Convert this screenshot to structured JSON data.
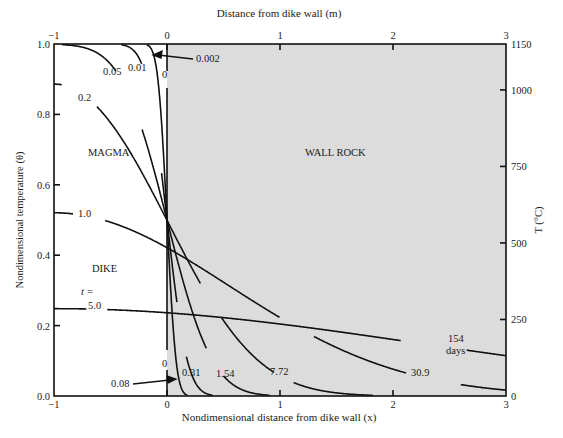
{
  "chart_data": {
    "type": "line",
    "title": "",
    "top_xlabel": "Distance from dike wall (m)",
    "xlabel": "Nondimensional distance from dike wall (x)",
    "ylabel": "Nondimensional temperature (θ)",
    "right_ylabel": "T (°C)",
    "xlim": [
      -1,
      3
    ],
    "ylim": [
      0,
      1
    ],
    "right_ylim": [
      0,
      1150
    ],
    "x_ticks": [
      -1,
      0,
      1,
      2,
      3
    ],
    "x_tick_labels": [
      "−1",
      "0",
      "1",
      "2",
      "3"
    ],
    "top_x_ticks": [
      -1,
      0,
      1,
      2,
      3
    ],
    "top_x_tick_labels": [
      "−1",
      "0",
      "1",
      "2",
      "3"
    ],
    "y_ticks": [
      0.0,
      0.2,
      0.4,
      0.6,
      0.8,
      1.0
    ],
    "y_tick_labels": [
      "0.0",
      "0.2",
      "0.4",
      "0.6",
      "0.8",
      "1.0"
    ],
    "right_y_ticks": [
      0,
      250,
      500,
      750,
      1000,
      1150
    ],
    "right_y_tick_labels": [
      "0",
      "250",
      "500",
      "750",
      "1000",
      "1150"
    ],
    "grid": false,
    "legend": "none (inline curve labels)",
    "regions": [
      {
        "name": "MAGMA",
        "x_range": [
          -1,
          0
        ],
        "fill": "#ffffff"
      },
      {
        "name": "WALL ROCK",
        "x_range": [
          0,
          3
        ],
        "fill": "#dcdcdc"
      }
    ],
    "region_labels": {
      "magma": "MAGMA",
      "dike": "DIKE",
      "wall_rock": "WALL ROCK"
    },
    "model": "theta(x,t) = 0.5*[erf((x+2)/(2*sqrt(t))) - erf(x/(2*sqrt(t)))]",
    "series": [
      {
        "name": "t = 0",
        "t": 0,
        "label": "0",
        "note": "step function: θ=1 for x<0, θ=0 for x>0"
      },
      {
        "name": "t = 0.002",
        "t": 0.002,
        "label": "0.002",
        "days": 0.08
      },
      {
        "name": "t = 0.01",
        "t": 0.01,
        "label": "0.01",
        "days": 0.31
      },
      {
        "name": "t = 0.05",
        "t": 0.05,
        "label": "0.05",
        "days": 1.54
      },
      {
        "name": "t = 0.2",
        "t": 0.2,
        "label": "0.2",
        "days": 7.72
      },
      {
        "name": "t = 1.0",
        "t": 1.0,
        "label": "1.0",
        "days": 30.9
      },
      {
        "name": "t = 5.0",
        "t": 5.0,
        "label": "5.0",
        "days": 154
      }
    ],
    "sample_values": {
      "theta_at_x_minus1": {
        "0.002": 1.0,
        "0.01": 1.0,
        "0.05": 1.0,
        "0.2": 0.886,
        "1.0": 0.52,
        "5.0": 0.248
      },
      "theta_at_x_0": {
        "0.002": 0.5,
        "0.01": 0.5,
        "0.05": 0.5,
        "0.2": 0.5,
        "1.0": 0.46,
        "5.0": 0.24
      }
    },
    "annotations": {
      "t_prefix": "t =",
      "days_unit": "days",
      "left_labels": [
        "0.05",
        "0.01",
        "0.2",
        "1.0",
        "5.0"
      ],
      "left_zero": "0",
      "right_day_labels": [
        "0.08",
        "0.31",
        "1.54",
        "7.72",
        "30.9",
        "154"
      ],
      "right_zero": "0",
      "top_arrow_label": "0.002",
      "bottom_arrow_label": "0.08"
    }
  },
  "colors": {
    "wall_rock_fill": "#dcdcdc",
    "line": "#111111",
    "background": "#ffffff"
  }
}
